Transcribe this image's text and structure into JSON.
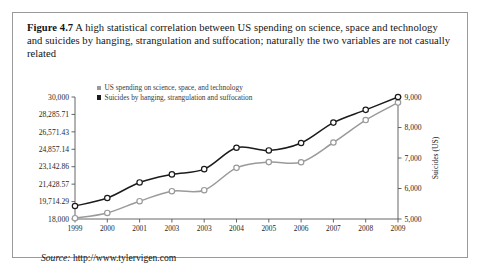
{
  "figure": {
    "number_label": "Figure 4.7",
    "caption": "A high statistical correlation between US spending on science, space and technology and suicides by hanging, strangulation and suffocation; naturally the two variables are not casually related",
    "source_label": "Source:",
    "source_url": "http://www.tylervigen.com"
  },
  "colors": {
    "spending_line": "#9a9a9a",
    "suicides_line": "#1b1b1b",
    "border": "#9a9a9a",
    "text": "#141414"
  },
  "chart_data": {
    "type": "line",
    "title": "",
    "xlabel": "",
    "ylabel": "",
    "grid": false,
    "legend_position": "top-left",
    "categories": [
      "1999",
      "2000",
      "2001",
      "2003",
      "2003",
      "2004",
      "2005",
      "2006",
      "2007",
      "2008",
      "2009"
    ],
    "x_tick_labels": [
      "1999",
      "2000",
      "2001",
      "2003",
      "2003",
      "2004",
      "2005",
      "2006",
      "2007",
      "2008",
      "2009"
    ],
    "left_axis": {
      "name": "US spending on science, space, and technology",
      "unit": "",
      "ylim": [
        18000,
        30000
      ],
      "tick_labels": [
        "30,000",
        "28,285.71",
        "26,571.43",
        "24,857.14",
        "23,142.86",
        "21,428.57",
        "19,714.29",
        "18,000"
      ],
      "tick_values": [
        30000,
        28285.71,
        26571.43,
        24857.14,
        23142.86,
        21428.57,
        19714.29,
        18000
      ]
    },
    "right_axis": {
      "name": "Suicides (US)",
      "ylim": [
        5000,
        9000
      ],
      "tick_labels": [
        "9,000",
        "8,000",
        "7,000",
        "6,000",
        "5,000"
      ],
      "tick_values": [
        9000,
        8000,
        7000,
        6000,
        5000
      ]
    },
    "series": [
      {
        "name": "US spending on science, space, and technology",
        "axis": "left",
        "color": "#9a9a9a",
        "marker": "open-circle",
        "values": [
          18079,
          18594,
          19753,
          20734,
          20831,
          23029,
          23597,
          23584,
          25525,
          27731,
          29449
        ]
      },
      {
        "name": "Suicides by hanging, strangulation and suffocation",
        "axis": "right",
        "color": "#1b1b1b",
        "marker": "open-circle",
        "values": [
          5427,
          5688,
          6198,
          6462,
          6635,
          7336,
          7248,
          7491,
          8161,
          8578,
          9000
        ]
      }
    ]
  }
}
